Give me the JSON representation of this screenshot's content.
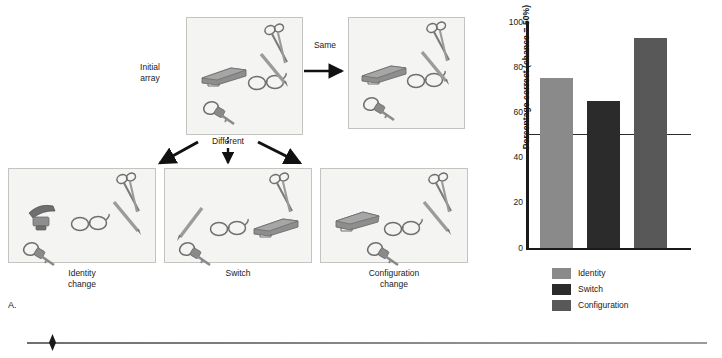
{
  "figure": {
    "panel_a": {
      "letter": "A.",
      "labels": {
        "initial_array": "Initial\narray",
        "same": "Same",
        "different": "Different",
        "identity_change": "Identity\nchange",
        "switch": "Switch",
        "configuration_change": "Configuration\nchange"
      },
      "panels": [
        {
          "name": "initial-array",
          "objects": [
            "stapler",
            "glasses",
            "scissors",
            "pencil",
            "keys"
          ]
        },
        {
          "name": "same-array",
          "objects": [
            "stapler",
            "glasses",
            "scissors",
            "pencil",
            "keys"
          ]
        },
        {
          "name": "identity-change-array",
          "objects": [
            "hole-punch",
            "glasses",
            "scissors",
            "pencil",
            "keys"
          ]
        },
        {
          "name": "switch-array",
          "objects": [
            "pencil",
            "glasses",
            "stapler",
            "scissors",
            "keys"
          ]
        },
        {
          "name": "configuration-change-array",
          "objects": [
            "stapler",
            "glasses",
            "scissors",
            "pencil",
            "keys"
          ]
        }
      ]
    },
    "panel_b": {
      "letter": "B."
    }
  },
  "chart_data": {
    "type": "bar",
    "title": "",
    "xlabel": "",
    "ylabel": "Percentage correct (chance = 50%)",
    "categories": [
      "Identity",
      "Switch",
      "Configuration"
    ],
    "values": [
      75,
      65,
      93
    ],
    "ylim": [
      0,
      100
    ],
    "yticks": [
      0,
      20,
      40,
      60,
      80,
      100
    ],
    "ytick_labels": [
      "0",
      "20",
      "40",
      "60",
      "80",
      "100"
    ],
    "grid": false,
    "legend_position": "bottom",
    "legend": [
      {
        "label": "Identity",
        "color": "#8a8a8a"
      },
      {
        "label": "Switch",
        "color": "#2b2b2b"
      },
      {
        "label": "Configuration",
        "color": "#585858"
      }
    ],
    "reference_line": {
      "label": "chance",
      "value": 50,
      "color": "#2b2b2b"
    },
    "colors": {
      "identity": "#8a8a8a",
      "switch": "#2b2b2b",
      "configuration": "#585858",
      "axis": "#1a1a1a"
    }
  }
}
